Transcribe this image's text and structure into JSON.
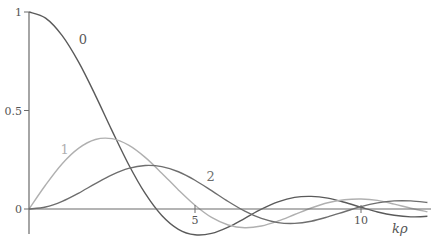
{
  "chart_data": {
    "type": "line",
    "title": "",
    "xlabel": "kρ",
    "ylabel": "",
    "xlim": [
      0,
      12.1
    ],
    "ylim": [
      -0.15,
      1.0
    ],
    "grid": false,
    "legend": "inline curve labels",
    "x_ticks": [
      {
        "value": 5,
        "label": "5"
      },
      {
        "value": 10,
        "label": "10"
      }
    ],
    "y_ticks": [
      {
        "value": 0,
        "label": "0"
      },
      {
        "value": 0.5,
        "label": "0.5"
      },
      {
        "value": 1,
        "label": "1"
      }
    ],
    "x": [
      0,
      0.5,
      1,
      1.5,
      2,
      2.5,
      3,
      3.5,
      4,
      4.5,
      5,
      5.5,
      6,
      6.5,
      7,
      7.5,
      8,
      8.5,
      9,
      9.5,
      10,
      10.5,
      11,
      11.5,
      12
    ],
    "series": [
      {
        "name": "0",
        "label": "0",
        "color": "#5a5a5a",
        "label_at": [
          1.5,
          0.84
        ],
        "values": [
          1,
          0.969,
          0.88,
          0.744,
          0.577,
          0.398,
          0.226,
          0.079,
          -0.033,
          -0.103,
          -0.131,
          -0.124,
          -0.092,
          -0.047,
          -0.001,
          0.036,
          0.059,
          0.064,
          0.055,
          0.034,
          0.009,
          -0.015,
          -0.032,
          -0.04,
          -0.037
        ]
      },
      {
        "name": "1",
        "label": "1",
        "color": "#b0b0b0",
        "label_at": [
          0.95,
          0.28
        ],
        "values": [
          0,
          0.122,
          0.23,
          0.309,
          0.353,
          0.357,
          0.324,
          0.262,
          0.182,
          0.097,
          0.019,
          -0.043,
          -0.081,
          -0.095,
          -0.086,
          -0.061,
          -0.028,
          0.005,
          0.032,
          0.047,
          0.051,
          0.044,
          0.025,
          0.004,
          -0.014
        ]
      },
      {
        "name": "2",
        "label": "2",
        "color": "#6e6e6e",
        "label_at": [
          5.35,
          0.14
        ],
        "values": [
          0,
          0.01,
          0.039,
          0.081,
          0.129,
          0.173,
          0.206,
          0.221,
          0.215,
          0.189,
          0.146,
          0.093,
          0.038,
          -0.011,
          -0.048,
          -0.069,
          -0.073,
          -0.062,
          -0.04,
          -0.014,
          0.012,
          0.031,
          0.041,
          0.041,
          0.033
        ]
      }
    ]
  }
}
